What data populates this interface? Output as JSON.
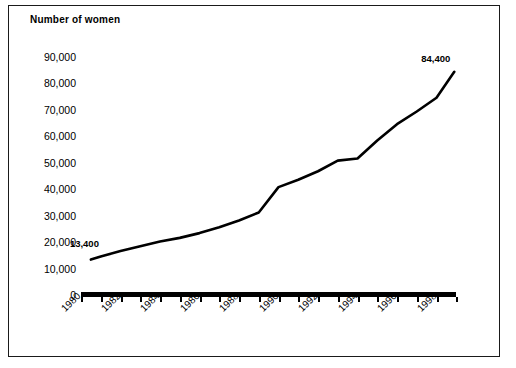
{
  "chart_data": {
    "type": "line",
    "title": "Number of women",
    "xlabel": "",
    "ylabel": "",
    "ylim": [
      0,
      90000
    ],
    "xlim": [
      1980,
      1999
    ],
    "grid": false,
    "legend": false,
    "y_ticks": [
      "90,000",
      "80,000",
      "70,000",
      "60,000",
      "50,000",
      "40,000",
      "30,000",
      "20,000",
      "10,000",
      "0"
    ],
    "y_tick_values": [
      90000,
      80000,
      70000,
      60000,
      50000,
      40000,
      30000,
      20000,
      10000,
      0
    ],
    "x_tick_labels": [
      "1980",
      "1982",
      "1984",
      "1986",
      "1988",
      "1990",
      "1992",
      "1994",
      "1996",
      "1998"
    ],
    "x_tick_values": [
      1980,
      1982,
      1984,
      1986,
      1988,
      1990,
      1992,
      1994,
      1996,
      1998
    ],
    "x": [
      1980.5,
      1981,
      1982,
      1983,
      1984,
      1985,
      1986,
      1987,
      1988,
      1989,
      1990,
      1991,
      1992,
      1993,
      1994,
      1995,
      1996,
      1997,
      1998,
      1998.9
    ],
    "values": [
      13400,
      14600,
      16600,
      18400,
      20200,
      21600,
      23400,
      25600,
      28200,
      31200,
      40800,
      43600,
      46800,
      50800,
      51600,
      58400,
      64600,
      69400,
      74600,
      84400
    ],
    "annotations": [
      {
        "text": "13,400",
        "value": 13400,
        "x": 1980.5,
        "position": "above-left"
      },
      {
        "text": "84,400",
        "value": 84400,
        "x": 1998.9,
        "position": "above-right"
      }
    ],
    "line_color": "#000000",
    "line_width": 2.6
  },
  "caption": {
    "cut_off_text": ""
  }
}
